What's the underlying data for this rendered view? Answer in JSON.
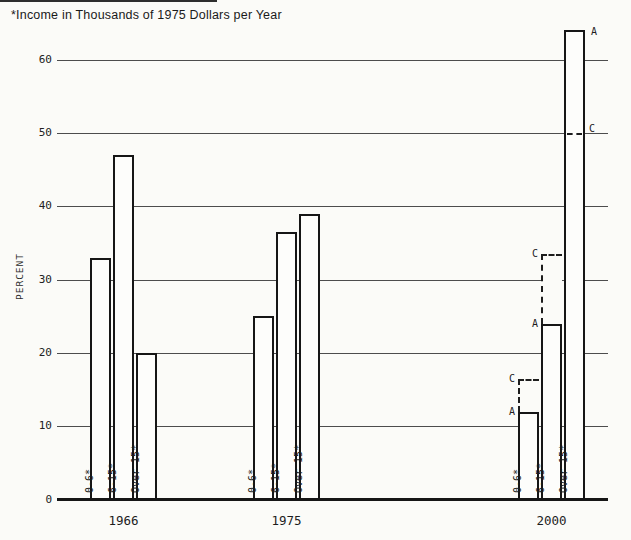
{
  "title": "*Income in Thousands of 1975 Dollars per Year",
  "ylabel": "PERCENT",
  "scenario_labels": {
    "solid_bar": "A",
    "dashed_projection": "C"
  },
  "chart_data": {
    "type": "bar",
    "title": "*Income in Thousands of 1975 Dollars per Year",
    "xlabel": "",
    "ylabel": "PERCENT",
    "ylim": [
      0,
      66
    ],
    "yticks": [
      0,
      10,
      20,
      30,
      40,
      50,
      60
    ],
    "grid": true,
    "legend": "none",
    "categories": [
      "1966",
      "1975",
      "2000"
    ],
    "bar_labels": [
      "0-6*",
      "6-15*",
      "Over 15*"
    ],
    "groups": [
      {
        "year": "1966",
        "bars": [
          {
            "label": "0-6*",
            "value": 33
          },
          {
            "label": "6-15*",
            "value": 47
          },
          {
            "label": "Over 15*",
            "value": 20
          }
        ]
      },
      {
        "year": "1975",
        "bars": [
          {
            "label": "0-6*",
            "value": 25
          },
          {
            "label": "6-15*",
            "value": 36.5
          },
          {
            "label": "Over 15*",
            "value": 39
          }
        ]
      },
      {
        "year": "2000",
        "bars": [
          {
            "label": "0-6*",
            "value": 12,
            "scenario_A": 12,
            "scenario_C": 16.5
          },
          {
            "label": "6-15*",
            "value": 24,
            "scenario_A": 24,
            "scenario_C": 33.5
          },
          {
            "label": "Over 15*",
            "value": 64,
            "scenario_A": 64,
            "scenario_C": 50
          }
        ]
      }
    ]
  },
  "colors": {
    "background": "#fbfbf8",
    "grid_line": "#4d4d4d",
    "axis_line": "#161616",
    "bar_border": "#161616",
    "bar_fill": "#fdfdfb",
    "text": "#1d1d1d"
  }
}
